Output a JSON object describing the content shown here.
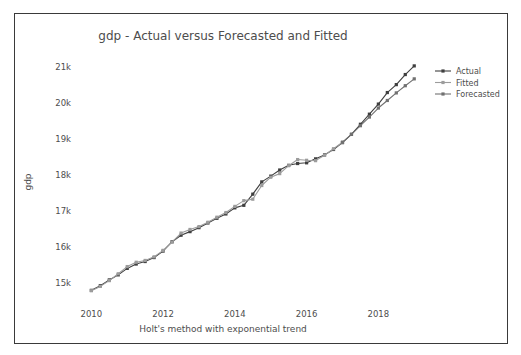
{
  "chart_data": {
    "type": "line",
    "title": "gdp - Actual versus Forecasted and Fitted",
    "xlabel": "Holt's method with exponential trend",
    "ylabel": "gdp",
    "xlim": [
      2009.6,
      2019.3
    ],
    "ylim": [
      14550,
      21350
    ],
    "grid": false,
    "legend_position": "upper right",
    "xticks": [
      2010,
      2012,
      2014,
      2016,
      2018
    ],
    "xtick_labels": [
      "2010",
      "2012",
      "2014",
      "2016",
      "2018"
    ],
    "yticks": [
      15000,
      16000,
      17000,
      18000,
      19000,
      20000,
      21000
    ],
    "ytick_labels": [
      "15k",
      "16k",
      "17k",
      "18k",
      "19k",
      "20k",
      "21k"
    ],
    "series": [
      {
        "name": "Actual",
        "color": "#3f3f3f",
        "marker": "square",
        "x": [
          2010.0,
          2010.25,
          2010.5,
          2010.75,
          2011.0,
          2011.25,
          2011.5,
          2011.75,
          2012.0,
          2012.25,
          2012.5,
          2012.75,
          2013.0,
          2013.25,
          2013.5,
          2013.75,
          2014.0,
          2014.25,
          2014.5,
          2014.75,
          2015.0,
          2015.25,
          2015.5,
          2015.75,
          2016.0,
          2016.25,
          2016.5,
          2016.75,
          2017.0,
          2017.25,
          2017.5,
          2017.75,
          2018.0,
          2018.25,
          2018.5,
          2018.75,
          2019.0
        ],
        "y": [
          14790,
          14920,
          15080,
          15220,
          15400,
          15520,
          15590,
          15700,
          15880,
          16140,
          16320,
          16420,
          16530,
          16660,
          16790,
          16910,
          17080,
          17150,
          17460,
          17800,
          17960,
          18130,
          18260,
          18310,
          18330,
          18440,
          18550,
          18700,
          18890,
          19120,
          19400,
          19680,
          19960,
          20280,
          20500,
          20780,
          21020
        ]
      },
      {
        "name": "Fitted",
        "color": "#9c9c9c",
        "marker": "square",
        "x": [
          2010.0,
          2010.25,
          2010.5,
          2010.75,
          2011.0,
          2011.25,
          2011.5,
          2011.75,
          2012.0,
          2012.25,
          2012.5,
          2012.75,
          2013.0,
          2013.25,
          2013.5,
          2013.75,
          2014.0,
          2014.25,
          2014.5,
          2014.75,
          2015.0,
          2015.25,
          2015.5,
          2015.75,
          2016.0,
          2016.25,
          2016.5,
          2016.75,
          2017.0
        ],
        "y": [
          14780,
          14900,
          15060,
          15250,
          15450,
          15570,
          15620,
          15720,
          15900,
          16130,
          16380,
          16480,
          16560,
          16680,
          16820,
          16950,
          17120,
          17280,
          17320,
          17700,
          17930,
          18030,
          18250,
          18420,
          18400,
          18390,
          18540,
          18720,
          18900
        ]
      },
      {
        "name": "Forecasted",
        "color": "#717171",
        "marker": "square",
        "x": [
          2017.0,
          2017.25,
          2017.5,
          2017.75,
          2018.0,
          2018.25,
          2018.5,
          2018.75,
          2019.0
        ],
        "y": [
          18900,
          19120,
          19360,
          19600,
          19850,
          20060,
          20270,
          20470,
          20660
        ]
      }
    ]
  },
  "legend": {
    "entries": [
      {
        "label": "Actual"
      },
      {
        "label": "Fitted"
      },
      {
        "label": "Forecasted"
      }
    ]
  }
}
